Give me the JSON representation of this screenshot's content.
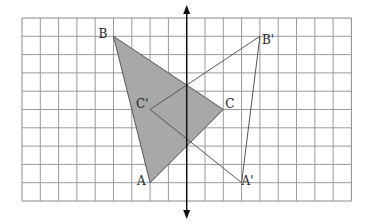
{
  "diagram": {
    "grid": {
      "origin_x": 22,
      "origin_y": 18,
      "cell": 18.3,
      "cols": 18,
      "rows": 10,
      "line_color": "#9a9a9a",
      "border_color": "#8a8a8a"
    },
    "axis": {
      "label": "line of reflection",
      "col": 9,
      "top_y": 5,
      "bottom_y": 219,
      "color": "#111111"
    },
    "fill_color": "#a8a8a8",
    "line_color": "#555555",
    "points": {
      "A": {
        "label": "A",
        "col": 7,
        "row": 9
      },
      "B": {
        "label": "B",
        "col": 5,
        "row": 1
      },
      "C": {
        "label": "C",
        "col": 11,
        "row": 5
      },
      "A_prime": {
        "label": "A'",
        "col": 12,
        "row": 9
      },
      "B_prime": {
        "label": "B'",
        "col": 13,
        "row": 1
      },
      "C_prime": {
        "label": "C'",
        "col": 7,
        "row": 5
      }
    }
  }
}
